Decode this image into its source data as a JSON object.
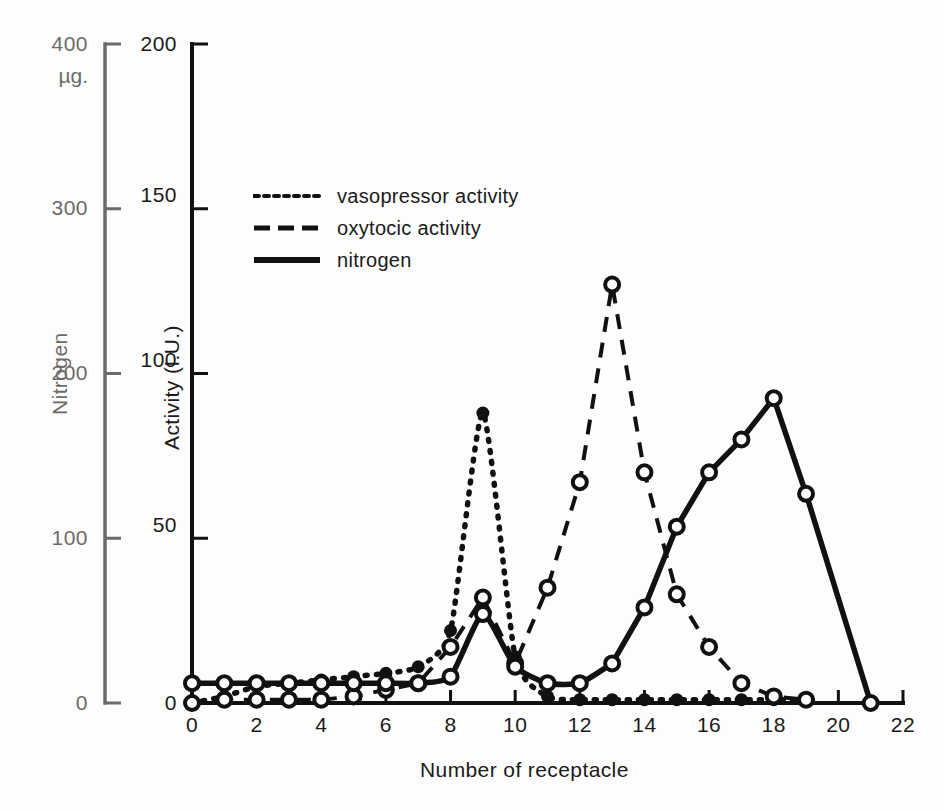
{
  "figure": {
    "background": "#fdfdfd",
    "ink_color": "#111111",
    "nitrogen_axis_color": "#6b6b6b"
  },
  "axes": {
    "x": {
      "label": "Number of receptacle",
      "min": 0,
      "max": 22,
      "ticks": [
        0,
        2,
        4,
        6,
        8,
        10,
        12,
        14,
        16,
        18,
        20,
        22
      ],
      "tick_labels": [
        "0",
        "2",
        "4",
        "6",
        "8",
        "10",
        "12",
        "14",
        "16",
        "18",
        "20",
        "22"
      ],
      "minor_tick_step": 2
    },
    "y_inner": {
      "label": "Activity (I.U.)",
      "min": 0,
      "max": 200,
      "ticks": [
        0,
        50,
        100,
        150,
        200
      ],
      "tick_labels": [
        "0",
        "50",
        "100",
        "150",
        "200"
      ]
    },
    "y_outer": {
      "label": "Nitrogen",
      "unit": "µg.",
      "min": 0,
      "max": 400,
      "ticks": [
        0,
        100,
        200,
        300,
        400
      ],
      "tick_labels": [
        "0",
        "100",
        "200",
        "300",
        "400"
      ]
    }
  },
  "legend": {
    "position": "upper-left-inside",
    "entries": [
      {
        "label": "vasopressor activity",
        "style": "dotted",
        "key": "vasopressor"
      },
      {
        "label": "oxytocic activity",
        "style": "dashed",
        "key": "oxytocic"
      },
      {
        "label": "nitrogen",
        "style": "solid",
        "key": "nitrogen"
      }
    ]
  },
  "chart_data": {
    "type": "line",
    "title": "",
    "xlabel": "Number of receptacle",
    "ylabel": "Activity (I.U.)",
    "ylabel_secondary": "Nitrogen (µg.)",
    "xlim": [
      0,
      22
    ],
    "ylim": [
      0,
      200
    ],
    "ylim_secondary": [
      0,
      400
    ],
    "grid": false,
    "legend_position": "upper left",
    "x": [
      0,
      1,
      2,
      3,
      4,
      5,
      6,
      7,
      8,
      9,
      10,
      11,
      12,
      13,
      14,
      15,
      16,
      17,
      18,
      19,
      20,
      21
    ],
    "series": [
      {
        "name": "vasopressor activity",
        "axis": "left",
        "style": "dotted",
        "marker": "filled-circle",
        "values": [
          0,
          2,
          5,
          6,
          7,
          8,
          9,
          11,
          22,
          88,
          14,
          2,
          1,
          1,
          1,
          1,
          1,
          1,
          1,
          1,
          null,
          null
        ]
      },
      {
        "name": "oxytocic activity",
        "axis": "left",
        "style": "dashed",
        "marker": "open-circle",
        "values": [
          0,
          1,
          1,
          1,
          1,
          2,
          4,
          6,
          17,
          32,
          12,
          35,
          67,
          127,
          70,
          33,
          17,
          6,
          2,
          1,
          null,
          null
        ]
      },
      {
        "name": "nitrogen",
        "axis": "right",
        "style": "solid",
        "marker": "open-circle",
        "values_ug": [
          12,
          12,
          12,
          12,
          12,
          12,
          12,
          12,
          16,
          54,
          22,
          12,
          12,
          24,
          58,
          107,
          140,
          160,
          185,
          127,
          null,
          0
        ],
        "values": [
          6,
          6,
          6,
          6,
          6,
          6,
          6,
          6,
          8,
          27,
          11,
          6,
          6,
          12,
          29,
          53.5,
          70,
          80,
          92.5,
          63.5,
          null,
          0
        ]
      }
    ],
    "annotations": {
      "vasopressor_peak": {
        "x": 9,
        "y": 88
      },
      "oxytocic_peak": {
        "x": 13,
        "y": 127
      },
      "nitrogen_peak": {
        "x": 18,
        "y_ug": 370
      }
    }
  }
}
